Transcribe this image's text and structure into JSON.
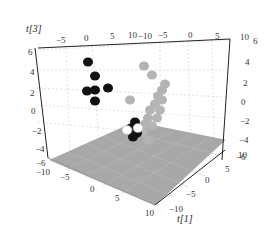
{
  "chart_data": {
    "type": "scatter",
    "subtype": "3d-scatter",
    "title": "",
    "axes": {
      "x": {
        "label": "t[1]",
        "ticks": [
          "-10",
          "-5",
          "0",
          "5",
          "10"
        ],
        "range": [
          -10,
          10
        ]
      },
      "y": {
        "label": "",
        "ticks": [
          "-10",
          "-5",
          "0",
          "5",
          "10"
        ],
        "range": [
          -10,
          10
        ]
      },
      "z": {
        "label": "t[3]",
        "ticks": [
          "-6",
          "-4",
          "-2",
          "0",
          "2",
          "4",
          "6"
        ],
        "range": [
          -6,
          6
        ]
      }
    },
    "grid": true,
    "floor_color": "#aaaaaa",
    "legend": null,
    "series": [
      {
        "name": "black group",
        "color": "#111111",
        "points_screen": [
          [
            88,
            62
          ],
          [
            95,
            76
          ],
          [
            87,
            91
          ],
          [
            95,
            90
          ],
          [
            108,
            88
          ],
          [
            95,
            101
          ],
          [
            135,
            122
          ],
          [
            131,
            128
          ],
          [
            137,
            133
          ],
          [
            133,
            137
          ]
        ]
      },
      {
        "name": "white group",
        "color": "#ffffff",
        "points_screen": [
          [
            127,
            130
          ],
          [
            138,
            128
          ]
        ]
      },
      {
        "name": "gray group",
        "color": "#b4b4b4",
        "points_screen": [
          [
            144,
            66
          ],
          [
            152,
            75
          ],
          [
            130,
            100
          ],
          [
            165,
            84
          ],
          [
            162,
            90
          ],
          [
            158,
            96
          ],
          [
            155,
            104
          ],
          [
            150,
            110
          ],
          [
            148,
            118
          ],
          [
            145,
            124
          ],
          [
            143,
            132
          ],
          [
            160,
            110
          ],
          [
            157,
            118
          ],
          [
            152,
            126
          ],
          [
            162,
            100
          ],
          [
            148,
            140
          ]
        ]
      }
    ]
  }
}
